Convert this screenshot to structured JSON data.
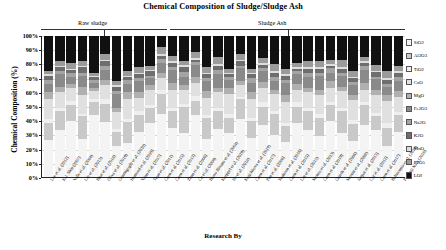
{
  "chart_data": {
    "type": "bar",
    "title": "Chemical Composition of Sludge/Sludge Ash",
    "xlabel": "Research By",
    "ylabel": "Chemical Composition (%)",
    "stacked": true,
    "stack_mode": "percent",
    "ylim": [
      0,
      100
    ],
    "ytick_labels": [
      "0%",
      "10%",
      "20%",
      "30%",
      "40%",
      "50%",
      "60%",
      "70%",
      "80%",
      "90%",
      "100%"
    ],
    "ytick_values": [
      0,
      10,
      20,
      30,
      40,
      50,
      60,
      70,
      80,
      90,
      100
    ],
    "grid": true,
    "legend_position": "right",
    "group_annotations": [
      {
        "label": "Raw sludge",
        "start_index": 0,
        "end_index": 9
      },
      {
        "label": "Sludge Ash",
        "start_index": 10,
        "end_index": 29
      }
    ],
    "categories": [
      "Lee et al. (2012)",
      "K.J. Shin (2007)",
      "Valls et al. (2004)",
      "Liu et al. (2013)",
      "Bhat et al. (2018)",
      "Oliva et al. (2019)",
      "Gunungoglu et al. (2020)",
      "Hamood et al. (2019)",
      "Yuan et al. (2017)",
      "Tuan et al. (2011)",
      "Chen et al. (2015)",
      "Chen et al. (2013)",
      "Zhan et al. (2008)",
      "Cu et al. (2006)",
      "Basso Bittana et al. (2004)",
      "Kaeppel et al. (2019)",
      "Ito et al. (2018)",
      "Krajchkova et al. (2019)",
      "Chen et al. (2017)",
      "Pan et al. (2008)",
      "Shahoon et al. (2016)",
      "Chen et al. (2015)",
      "Lin et al. (2015)",
      "Monzo et al. (2013)",
      "Chen et al. (2019)",
      "Gareth et al. (2006)",
      "Mosun et al. (2008)",
      "Jaupar et al. (2013)",
      "Cyr et al. (2012)",
      "Chen et al. (2017)",
      "Baltussmia et al. (2016)",
      "Ponamji Naik (2016)"
    ],
    "series": [
      {
        "name": "SiO2",
        "color": "#f4f4f4",
        "values": [
          26,
          33,
          40,
          27,
          44,
          39,
          22,
          24,
          32,
          38,
          45,
          35,
          30,
          42,
          27,
          34,
          31,
          41,
          28,
          36,
          30,
          25,
          38,
          33,
          29,
          40,
          31,
          26,
          37,
          34,
          22,
          32
        ]
      },
      {
        "name": "Al2O3",
        "color": "#c9c9c9",
        "values": [
          12,
          14,
          11,
          16,
          9,
          13,
          10,
          15,
          12,
          11,
          14,
          12,
          18,
          10,
          15,
          13,
          11,
          14,
          12,
          13,
          15,
          11,
          12,
          14,
          13,
          11,
          16,
          12,
          14,
          10,
          13,
          12
        ]
      },
      {
        "name": "TiO2",
        "color": "#efefef",
        "values": [
          3,
          2,
          3,
          2,
          2,
          3,
          2,
          2,
          3,
          2,
          3,
          2,
          2,
          3,
          2,
          2,
          3,
          2,
          2,
          3,
          2,
          2,
          3,
          2,
          3,
          2,
          2,
          3,
          2,
          2,
          3,
          2
        ]
      },
      {
        "name": "CaO",
        "color": "#e0e0e0",
        "values": [
          14,
          11,
          9,
          13,
          6,
          10,
          12,
          14,
          9,
          11,
          8,
          13,
          10,
          9,
          12,
          11,
          14,
          8,
          13,
          10,
          12,
          15,
          9,
          11,
          13,
          10,
          12,
          14,
          9,
          13,
          16,
          11
        ]
      },
      {
        "name": "MgO",
        "color": "#b0b0b0",
        "values": [
          5,
          4,
          3,
          6,
          2,
          4,
          3,
          5,
          4,
          3,
          4,
          5,
          3,
          4,
          5,
          3,
          4,
          3,
          5,
          4,
          3,
          5,
          4,
          3,
          4,
          5,
          3,
          4,
          5,
          3,
          4,
          4
        ]
      },
      {
        "name": "Fe2O3",
        "color": "#8a8a8a",
        "values": [
          6,
          9,
          5,
          8,
          4,
          7,
          10,
          6,
          8,
          5,
          7,
          9,
          6,
          8,
          7,
          10,
          6,
          9,
          7,
          8,
          6,
          9,
          7,
          8,
          10,
          6,
          8,
          7,
          9,
          8,
          6,
          7
        ]
      },
      {
        "name": "Na2O",
        "color": "#a4a4a4",
        "values": [
          3,
          2,
          3,
          2,
          2,
          3,
          2,
          3,
          2,
          2,
          3,
          2,
          3,
          2,
          2,
          3,
          2,
          2,
          3,
          2,
          3,
          2,
          2,
          3,
          2,
          3,
          2,
          2,
          3,
          2,
          2,
          3
        ]
      },
      {
        "name": "K2O",
        "color": "#6e6e6e",
        "values": [
          3,
          3,
          2,
          4,
          2,
          3,
          3,
          2,
          3,
          3,
          2,
          3,
          4,
          2,
          3,
          3,
          2,
          3,
          3,
          2,
          3,
          3,
          2,
          3,
          3,
          2,
          3,
          3,
          2,
          3,
          3,
          3
        ]
      },
      {
        "name": "MnO",
        "color": "#dedede",
        "values": [
          1,
          1,
          1,
          1,
          1,
          1,
          1,
          1,
          1,
          1,
          1,
          1,
          1,
          1,
          1,
          1,
          1,
          1,
          1,
          1,
          1,
          1,
          1,
          1,
          1,
          1,
          1,
          1,
          1,
          1,
          1,
          1
        ]
      },
      {
        "name": "P2O5",
        "color": "#9b9b9b",
        "values": [
          2,
          3,
          4,
          3,
          2,
          4,
          3,
          3,
          4,
          3,
          5,
          4,
          3,
          4,
          4,
          5,
          3,
          4,
          3,
          4,
          5,
          4,
          3,
          4,
          4,
          3,
          5,
          4,
          3,
          4,
          5,
          4
        ]
      },
      {
        "name": "LOI",
        "color": "#111111",
        "values": [
          25,
          18,
          19,
          18,
          26,
          13,
          32,
          25,
          22,
          21,
          8,
          14,
          17,
          11,
          22,
          15,
          23,
          13,
          23,
          15,
          20,
          23,
          19,
          18,
          18,
          17,
          17,
          25,
          15,
          21,
          25,
          21
        ]
      }
    ]
  }
}
